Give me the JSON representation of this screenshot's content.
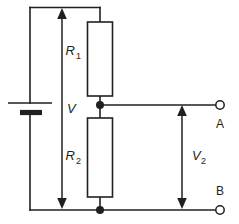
{
  "diagram": {
    "type": "schematic",
    "background_color": "#ffffff",
    "line_color": "#231f20"
  },
  "components": {
    "source": {
      "name": "battery",
      "symbol": "battery-cell",
      "label": "V",
      "label_subscript": ""
    },
    "resistor_top": {
      "name": "resistor-r1",
      "label": "R",
      "label_subscript": "1"
    },
    "resistor_bottom": {
      "name": "resistor-r2",
      "label": "R",
      "label_subscript": "2"
    }
  },
  "terminals": {
    "a": {
      "label": "A"
    },
    "b": {
      "label": "B"
    }
  },
  "measurements": {
    "supply": {
      "label": "V",
      "subscript": "",
      "style": "double-headed-arrow"
    },
    "output": {
      "label": "V",
      "subscript": "2",
      "style": "double-headed-arrow"
    }
  },
  "nodes": [
    {
      "name": "midpoint-junction"
    },
    {
      "name": "bottom-junction"
    }
  ]
}
